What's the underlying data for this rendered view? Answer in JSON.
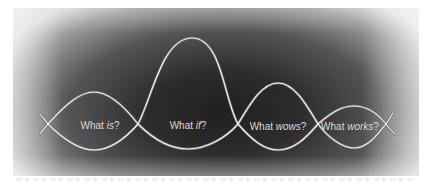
{
  "diagram": {
    "type": "design-thinking-waves",
    "colors": {
      "curve_stroke": "#f0f0f0",
      "curve_outline": "#7a7a7a",
      "label_text": "#d9d9d9",
      "background_center": "#202020",
      "background_edge": "#d8d8d8"
    },
    "stages": [
      {
        "prefix": "What ",
        "emphasis": "is",
        "suffix": "?"
      },
      {
        "prefix": "What ",
        "emphasis": "if",
        "suffix": "?"
      },
      {
        "prefix": "What ",
        "emphasis": "wows",
        "suffix": "?"
      },
      {
        "prefix": "What ",
        "emphasis": "works",
        "suffix": "?"
      }
    ]
  }
}
